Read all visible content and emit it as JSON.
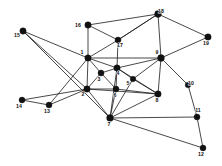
{
  "figure": {
    "title": "",
    "background_color": "#ffffff",
    "node_color": "#111111",
    "edge_color": "#1a1a1a",
    "label_color": "#111111",
    "width": 222,
    "height": 166
  },
  "chart_data": {
    "type": "scatter",
    "subtype": "node-link-graph",
    "title": "",
    "xlabel": "",
    "ylabel": "",
    "grid": false,
    "legend": false,
    "xlim": [
      0,
      222
    ],
    "ylim": [
      0,
      166
    ],
    "node_count": 19,
    "edge_count": 44,
    "nodes": [
      {
        "id": 1,
        "label": "1",
        "x": 88,
        "y": 58,
        "r": 3.2,
        "label_dx": -6,
        "label_dy": -4
      },
      {
        "id": 2,
        "label": "2",
        "x": 87,
        "y": 89,
        "r": 3.2,
        "label_dx": -4,
        "label_dy": 7
      },
      {
        "id": 3,
        "label": "3",
        "x": 101,
        "y": 73,
        "r": 3.0,
        "label_dx": -2,
        "label_dy": 8
      },
      {
        "id": 4,
        "label": "4",
        "x": 117,
        "y": 68,
        "r": 3.2,
        "label_dx": 1,
        "label_dy": 7
      },
      {
        "id": 5,
        "label": "5",
        "x": 133,
        "y": 79,
        "r": 2.8,
        "label_dx": -5,
        "label_dy": 6
      },
      {
        "id": 6,
        "label": "6",
        "x": 116,
        "y": 89,
        "r": 3.0,
        "label_dx": -1,
        "label_dy": 8
      },
      {
        "id": 7,
        "label": "7",
        "x": 110,
        "y": 118,
        "r": 3.4,
        "label_dx": -1,
        "label_dy": 8
      },
      {
        "id": 8,
        "label": "8",
        "x": 158,
        "y": 94,
        "r": 3.2,
        "label_dx": -1,
        "label_dy": 8
      },
      {
        "id": 9,
        "label": "9",
        "x": 161,
        "y": 58,
        "r": 3.4,
        "label_dx": -4,
        "label_dy": -4
      },
      {
        "id": 10,
        "label": "10",
        "x": 188,
        "y": 85,
        "r": 2.8,
        "label_dx": 3,
        "label_dy": 0
      },
      {
        "id": 11,
        "label": "11",
        "x": 197,
        "y": 117,
        "r": 3.0,
        "label_dx": 1,
        "label_dy": -5
      },
      {
        "id": 12,
        "label": "12",
        "x": 203,
        "y": 148,
        "r": 3.0,
        "label_dx": -2,
        "label_dy": 8
      },
      {
        "id": 13,
        "label": "13",
        "x": 49,
        "y": 105,
        "r": 3.0,
        "label_dx": -2,
        "label_dy": 8
      },
      {
        "id": 14,
        "label": "14",
        "x": 22,
        "y": 100,
        "r": 3.0,
        "label_dx": -3,
        "label_dy": 8
      },
      {
        "id": 15,
        "label": "15",
        "x": 23,
        "y": 31,
        "r": 3.2,
        "label_dx": -6,
        "label_dy": 6
      },
      {
        "id": 16,
        "label": "16",
        "x": 88,
        "y": 25,
        "r": 3.2,
        "label_dx": -10,
        "label_dy": 2
      },
      {
        "id": 17,
        "label": "17",
        "x": 118,
        "y": 40,
        "r": 3.0,
        "label_dx": 2,
        "label_dy": 7
      },
      {
        "id": 18,
        "label": "18",
        "x": 158,
        "y": 14,
        "r": 3.4,
        "label_dx": 3,
        "label_dy": -1
      },
      {
        "id": 19,
        "label": "19",
        "x": 208,
        "y": 37,
        "r": 3.2,
        "label_dx": -2,
        "label_dy": 8
      }
    ],
    "edges": [
      [
        15,
        1
      ],
      [
        15,
        2
      ],
      [
        15,
        7
      ],
      [
        16,
        1
      ],
      [
        16,
        17
      ],
      [
        16,
        18
      ],
      [
        17,
        1
      ],
      [
        17,
        4
      ],
      [
        17,
        18
      ],
      [
        18,
        9
      ],
      [
        18,
        19
      ],
      [
        18,
        17
      ],
      [
        19,
        9
      ],
      [
        1,
        2
      ],
      [
        1,
        3
      ],
      [
        1,
        4
      ],
      [
        1,
        9
      ],
      [
        1,
        13
      ],
      [
        2,
        3
      ],
      [
        2,
        6
      ],
      [
        2,
        7
      ],
      [
        2,
        8
      ],
      [
        2,
        13
      ],
      [
        2,
        14
      ],
      [
        3,
        4
      ],
      [
        3,
        6
      ],
      [
        4,
        5
      ],
      [
        4,
        6
      ],
      [
        4,
        8
      ],
      [
        4,
        9
      ],
      [
        4,
        7
      ],
      [
        5,
        8
      ],
      [
        5,
        9
      ],
      [
        5,
        7
      ],
      [
        6,
        7
      ],
      [
        6,
        8
      ],
      [
        7,
        8
      ],
      [
        7,
        11
      ],
      [
        7,
        12
      ],
      [
        8,
        9
      ],
      [
        9,
        10
      ],
      [
        10,
        11
      ],
      [
        11,
        12
      ],
      [
        13,
        14
      ]
    ]
  }
}
